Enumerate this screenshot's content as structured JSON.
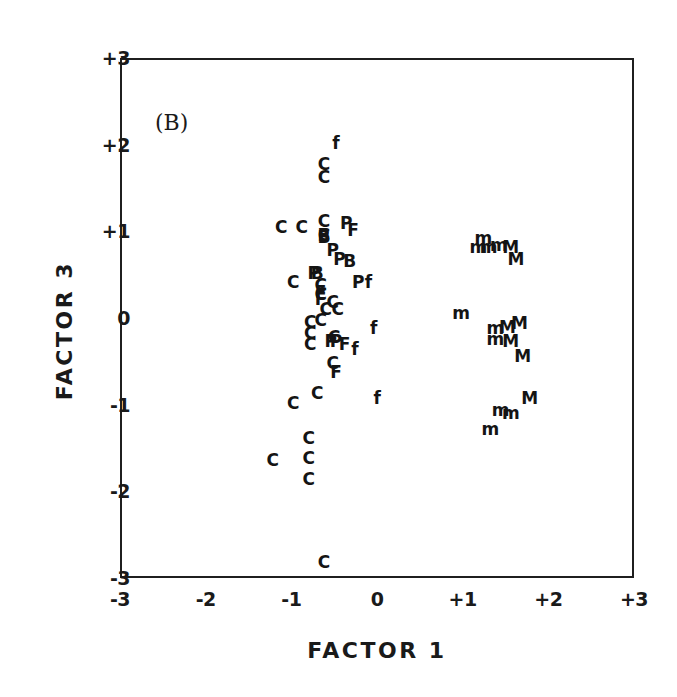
{
  "figure": {
    "panel_label": "(B)",
    "background_color": "#ffffff",
    "ink_color": "#141414"
  },
  "axes": {
    "x_title": "FACTOR 1",
    "y_title": "FACTOR 3",
    "x_ticks": [
      "-3",
      "-2",
      "-1",
      "0",
      "+1",
      "+2",
      "+3"
    ],
    "y_ticks": [
      "+3",
      "+2",
      "+1",
      "0",
      "-1",
      "-2",
      "-3"
    ]
  },
  "chart_data": {
    "type": "scatter",
    "title": "(B)",
    "xlabel": "FACTOR 1",
    "ylabel": "FACTOR 3",
    "xlim": [
      -3,
      3
    ],
    "ylim": [
      -3,
      3
    ],
    "xticks": [
      -3,
      -2,
      -1,
      0,
      1,
      2,
      3
    ],
    "yticks": [
      -3,
      -2,
      -1,
      0,
      1,
      2,
      3
    ],
    "xticklabels": [
      "-3",
      "-2",
      "-1",
      "0",
      "+1",
      "+2",
      "+3"
    ],
    "yticklabels": [
      "-3",
      "-2",
      "-1",
      "0",
      "+1",
      "+2",
      "+3"
    ],
    "grid": false,
    "legend": null,
    "marker_style": "text-letter",
    "note": "Each data point is drawn as a letter glyph denoting its group label (C, P, B, F, f, m, M).",
    "groups": [
      "C",
      "P",
      "B",
      "F",
      "f",
      "m",
      "M"
    ],
    "series": [
      {
        "name": "C",
        "label": "C",
        "count": 27,
        "points": [
          [
            -0.62,
            1.78
          ],
          [
            -0.62,
            1.63
          ],
          [
            -1.12,
            1.05
          ],
          [
            -0.88,
            1.05
          ],
          [
            -0.62,
            1.12
          ],
          [
            -0.62,
            0.96
          ],
          [
            -0.98,
            0.42
          ],
          [
            -0.66,
            0.38
          ],
          [
            -0.66,
            0.28
          ],
          [
            -0.52,
            0.18
          ],
          [
            -0.6,
            0.1
          ],
          [
            -0.46,
            0.1
          ],
          [
            -0.78,
            -0.05
          ],
          [
            -0.78,
            -0.17
          ],
          [
            -0.78,
            -0.3
          ],
          [
            -0.66,
            -0.02
          ],
          [
            -0.5,
            -0.22
          ],
          [
            -0.52,
            -0.52
          ],
          [
            -0.7,
            -0.86
          ],
          [
            -0.98,
            -0.98
          ],
          [
            -0.8,
            -1.38
          ],
          [
            -1.22,
            -1.64
          ],
          [
            -0.8,
            -1.62
          ],
          [
            -0.8,
            -1.86
          ],
          [
            -0.62,
            -2.82
          ]
        ]
      },
      {
        "name": "P",
        "label": "P",
        "count": 7,
        "points": [
          [
            -0.36,
            1.1
          ],
          [
            -0.52,
            0.78
          ],
          [
            -0.44,
            0.68
          ],
          [
            -0.74,
            0.52
          ],
          [
            -0.22,
            0.42
          ],
          [
            -0.54,
            -0.26
          ],
          [
            -0.48,
            -0.26
          ]
        ]
      },
      {
        "name": "B",
        "label": "B",
        "count": 4,
        "points": [
          [
            -0.62,
            0.94
          ],
          [
            -0.32,
            0.66
          ],
          [
            -0.7,
            0.52
          ],
          [
            -0.62,
            0.96
          ]
        ]
      },
      {
        "name": "F",
        "label": "F",
        "count": 5,
        "points": [
          [
            -0.28,
            1.02
          ],
          [
            -0.66,
            0.3
          ],
          [
            -0.38,
            -0.3
          ],
          [
            -0.48,
            -0.62
          ],
          [
            -0.66,
            0.22
          ]
        ]
      },
      {
        "name": "f",
        "label": "f",
        "count": 5,
        "points": [
          [
            -0.48,
            2.02
          ],
          [
            -0.1,
            0.42
          ],
          [
            -0.04,
            -0.12
          ],
          [
            0.0,
            -0.92
          ],
          [
            -0.26,
            -0.36
          ]
        ]
      },
      {
        "name": "m",
        "label": "m",
        "count": 12,
        "points": [
          [
            1.24,
            0.92
          ],
          [
            1.18,
            0.82
          ],
          [
            1.3,
            0.82
          ],
          [
            1.42,
            0.84
          ],
          [
            0.98,
            0.06
          ],
          [
            1.38,
            -0.12
          ],
          [
            1.38,
            -0.24
          ],
          [
            1.44,
            -1.06
          ],
          [
            1.56,
            -1.1
          ],
          [
            1.32,
            -1.28
          ]
        ]
      },
      {
        "name": "M",
        "label": "M",
        "count": 8,
        "points": [
          [
            1.56,
            0.82
          ],
          [
            1.62,
            0.68
          ],
          [
            1.52,
            -0.1
          ],
          [
            1.66,
            -0.06
          ],
          [
            1.56,
            -0.26
          ],
          [
            1.7,
            -0.44
          ],
          [
            1.78,
            -0.92
          ]
        ]
      }
    ]
  }
}
